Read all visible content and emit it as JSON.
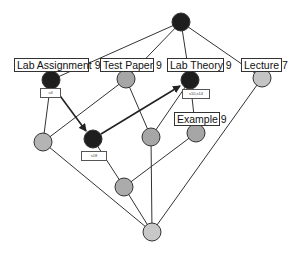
{
  "diagram": {
    "type": "lattice-graph",
    "colors": {
      "dark_node": "#1e1e1e",
      "grey_node": "#a6a6a6",
      "light_node": "#c4c4c4",
      "edge": "#333333"
    },
    "nodes": [
      {
        "id": "top",
        "x": 181,
        "y": 22,
        "r": 9,
        "color": "dark"
      },
      {
        "id": "lab-assignment-9",
        "label": "Lab Assignment 9",
        "x": 51,
        "y": 80,
        "r": 9,
        "color": "dark",
        "tag": "s4"
      },
      {
        "id": "test-paper-9",
        "label": "Test Paper 9",
        "x": 126,
        "y": 79,
        "r": 9,
        "color": "grey"
      },
      {
        "id": "lab-theory-9",
        "label": "Lab Theory 9",
        "x": 190,
        "y": 80,
        "r": 9,
        "color": "dark",
        "tag": "s10,s14"
      },
      {
        "id": "lecture-7",
        "label": "Lecture 7",
        "x": 262,
        "y": 78,
        "r": 9,
        "color": "light"
      },
      {
        "id": "left-grey",
        "x": 43,
        "y": 142,
        "r": 9,
        "color": "light"
      },
      {
        "id": "mid-dark",
        "x": 93,
        "y": 139,
        "r": 9,
        "color": "dark",
        "tag": "s18"
      },
      {
        "id": "mid-grey",
        "x": 151,
        "y": 137,
        "r": 9,
        "color": "grey"
      },
      {
        "id": "example-9",
        "label": "Example 9",
        "x": 196,
        "y": 133,
        "r": 9,
        "color": "grey"
      },
      {
        "id": "lower-mid",
        "x": 124,
        "y": 187,
        "r": 9,
        "color": "grey"
      },
      {
        "id": "bottom",
        "x": 152,
        "y": 232,
        "r": 9,
        "color": "light"
      }
    ],
    "edges": [
      [
        "top",
        "lab-assignment-9"
      ],
      [
        "top",
        "test-paper-9"
      ],
      [
        "top",
        "lab-theory-9"
      ],
      [
        "top",
        "lecture-7"
      ],
      [
        "lab-assignment-9",
        "left-grey"
      ],
      [
        "test-paper-9",
        "left-grey"
      ],
      [
        "test-paper-9",
        "mid-grey"
      ],
      [
        "lab-theory-9",
        "mid-grey"
      ],
      [
        "lab-theory-9",
        "example-9"
      ],
      [
        "lecture-7",
        "bottom"
      ],
      [
        "left-grey",
        "bottom"
      ],
      [
        "mid-dark",
        "lower-mid"
      ],
      [
        "example-9",
        "lower-mid"
      ],
      [
        "mid-grey",
        "bottom"
      ],
      [
        "lower-mid",
        "bottom"
      ]
    ],
    "arrows": [
      [
        "lab-assignment-9",
        "mid-dark"
      ],
      [
        "mid-dark",
        "lab-theory-9"
      ]
    ]
  },
  "labels": {
    "lab_assignment": "Lab Assignment 9",
    "test_paper": "Test Paper 9",
    "lab_theory": "Lab Theory 9",
    "lecture": "Lecture 7",
    "example": "Example 9"
  },
  "tags": {
    "lab_assignment": "s4",
    "mid_dark": "s18",
    "lab_theory": "s10,s14"
  }
}
